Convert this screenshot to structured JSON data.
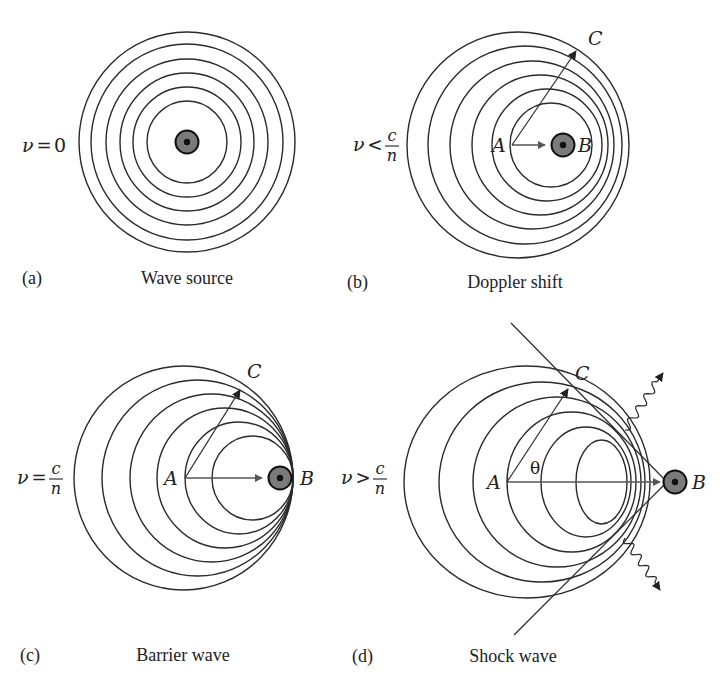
{
  "figure": {
    "width": 724,
    "height": 685,
    "colors": {
      "stroke": "#2a2a2a",
      "arrow": "#555555",
      "source_fill": "#7a7a7a",
      "source_core": "#111111"
    },
    "panels": [
      {
        "id": "a",
        "tag": "(a)",
        "caption": "Wave source",
        "condition": {
          "lhs": "ν",
          "op": "=",
          "rhs": "0"
        },
        "condition_pos": [
          22,
          146
        ],
        "tag_pos": [
          22,
          284
        ],
        "caption_pos": [
          187,
          284
        ],
        "waves": [
          {
            "cx": 187,
            "cy": 142,
            "rx": 108,
            "ry": 110
          },
          {
            "cx": 187,
            "cy": 142,
            "rx": 96,
            "ry": 98
          },
          {
            "cx": 187,
            "cy": 142,
            "rx": 81,
            "ry": 83
          },
          {
            "cx": 187,
            "cy": 142,
            "rx": 67,
            "ry": 69
          },
          {
            "cx": 187,
            "cy": 142,
            "rx": 54,
            "ry": 55
          },
          {
            "cx": 187,
            "cy": 142,
            "rx": 40,
            "ry": 41
          }
        ],
        "source": {
          "x": 187,
          "y": 142
        },
        "points": []
      },
      {
        "id": "b",
        "tag": "(b)",
        "caption": "Doppler shift",
        "condition": {
          "lhs": "ν",
          "op": "<",
          "num": "c",
          "den": "n"
        },
        "condition_pos": [
          353,
          145
        ],
        "tag_pos": [
          347,
          288
        ],
        "caption_pos": [
          515,
          288
        ],
        "waves": [
          {
            "cx": 518,
            "cy": 145,
            "rx": 111,
            "ry": 113
          },
          {
            "cx": 525,
            "cy": 145,
            "rx": 97,
            "ry": 99
          },
          {
            "cx": 532,
            "cy": 145,
            "rx": 82,
            "ry": 84
          },
          {
            "cx": 540,
            "cy": 145,
            "rx": 68,
            "ry": 70
          },
          {
            "cx": 547,
            "cy": 145,
            "rx": 55,
            "ry": 56
          },
          {
            "cx": 551,
            "cy": 145,
            "rx": 41,
            "ry": 42
          }
        ],
        "source": {
          "x": 563,
          "y": 145
        },
        "velocity_arrow": {
          "x1": 512,
          "y1": 145,
          "x2": 545,
          "y2": 145
        },
        "ray_arrow": {
          "x1": 512,
          "y1": 145,
          "x2": 576,
          "y2": 51
        },
        "points": [
          {
            "label": "A",
            "x": 492,
            "y": 152
          },
          {
            "label": "B",
            "x": 578,
            "y": 152
          },
          {
            "label": "C",
            "x": 588,
            "y": 45
          }
        ]
      },
      {
        "id": "c",
        "tag": "(c)",
        "caption": "Barrier wave",
        "condition": {
          "lhs": "ν",
          "op": "=",
          "num": "c",
          "den": "n"
        },
        "condition_pos": [
          17,
          478
        ],
        "tag_pos": [
          20,
          661
        ],
        "caption_pos": [
          183,
          661
        ],
        "waves": [
          {
            "cx": 183.5,
            "cy": 478,
            "rx": 109.5,
            "ry": 112
          },
          {
            "cx": 197.5,
            "cy": 478,
            "rx": 95.5,
            "ry": 98
          },
          {
            "cx": 211.5,
            "cy": 478,
            "rx": 81.5,
            "ry": 84
          },
          {
            "cx": 225,
            "cy": 478,
            "rx": 68,
            "ry": 70
          },
          {
            "cx": 239,
            "cy": 478,
            "rx": 54,
            "ry": 56
          },
          {
            "cx": 252.5,
            "cy": 478,
            "rx": 40.5,
            "ry": 42
          }
        ],
        "source": {
          "x": 280,
          "y": 478
        },
        "velocity_arrow": {
          "x1": 185,
          "y1": 478,
          "x2": 262,
          "y2": 478
        },
        "ray_arrow": {
          "x1": 185,
          "y1": 478,
          "x2": 240,
          "y2": 390
        },
        "points": [
          {
            "label": "A",
            "x": 164,
            "y": 485
          },
          {
            "label": "B",
            "x": 300,
            "y": 485
          },
          {
            "label": "C",
            "x": 247,
            "y": 378
          }
        ]
      },
      {
        "id": "d",
        "tag": "(d)",
        "caption": "Shock wave",
        "condition": {
          "lhs": "ν",
          "op": ">",
          "num": "c",
          "den": "n"
        },
        "condition_pos": [
          341,
          478
        ],
        "tag_pos": [
          352,
          662
        ],
        "caption_pos": [
          513,
          662
        ],
        "waves": [
          {
            "cx": 527,
            "cy": 482,
            "rx": 123,
            "ry": 116
          },
          {
            "cx": 542,
            "cy": 482,
            "rx": 103,
            "ry": 100
          },
          {
            "cx": 557,
            "cy": 482,
            "rx": 84,
            "ry": 85
          },
          {
            "cx": 571.5,
            "cy": 482,
            "rx": 64.5,
            "ry": 70
          },
          {
            "cx": 586,
            "cy": 482,
            "rx": 45,
            "ry": 55
          },
          {
            "cx": 601.5,
            "cy": 482,
            "rx": 25.5,
            "ry": 42
          }
        ],
        "source": {
          "x": 675,
          "y": 482
        },
        "velocity_arrow": {
          "x1": 507,
          "y1": 482,
          "x2": 660,
          "y2": 482
        },
        "ray_arrow": {
          "x1": 507,
          "y1": 482,
          "x2": 568,
          "y2": 389
        },
        "cone": {
          "upper": {
            "x1": 511,
            "y1": 323,
            "x2": 667,
            "y2": 482
          },
          "lower": {
            "x1": 667,
            "y1": 482,
            "x2": 514,
            "y2": 635
          }
        },
        "radiation": [
          {
            "x1": 625,
            "y1": 430,
            "x2": 663,
            "y2": 373
          },
          {
            "x1": 625,
            "y1": 538,
            "x2": 660,
            "y2": 590
          }
        ],
        "angle_label": {
          "text": "θ",
          "x": 530,
          "y": 474
        },
        "points": [
          {
            "label": "A",
            "x": 487,
            "y": 489
          },
          {
            "label": "B",
            "x": 692,
            "y": 489
          },
          {
            "label": "C",
            "x": 575,
            "y": 380
          }
        ]
      }
    ]
  }
}
